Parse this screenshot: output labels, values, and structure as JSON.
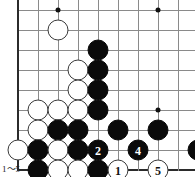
{
  "diagram": {
    "kind": "go-board-diagram",
    "caption": "1～5",
    "board": {
      "cell_size": 20,
      "origin_x": 18,
      "origin_y": 10,
      "cols": 9,
      "rows": 8,
      "left_edge_is_board_border": true,
      "bottom_edge_is_board_border": true,
      "line_color": "#8a8a8a",
      "edge_color": "#2b2b2b",
      "background": "#ffffff",
      "star_points": [
        {
          "col": 2,
          "row": 0
        },
        {
          "col": 7,
          "row": 0
        },
        {
          "col": 7,
          "row": 5
        }
      ]
    },
    "stone_colors": {
      "black": "#0a0a0a",
      "white": "#ffffff",
      "white_outline": "#3a3a3a",
      "black_number": "#ffffff",
      "white_number": "#111111"
    },
    "stones": [
      {
        "col": 2,
        "row": 1,
        "color": "white",
        "label": ""
      },
      {
        "col": 4,
        "row": 2,
        "color": "black",
        "label": ""
      },
      {
        "col": 3,
        "row": 3,
        "color": "white",
        "label": ""
      },
      {
        "col": 4,
        "row": 3,
        "color": "black",
        "label": ""
      },
      {
        "col": 3,
        "row": 4,
        "color": "white",
        "label": ""
      },
      {
        "col": 4,
        "row": 4,
        "color": "black",
        "label": ""
      },
      {
        "col": 1,
        "row": 5,
        "color": "white",
        "label": ""
      },
      {
        "col": 2,
        "row": 5,
        "color": "white",
        "label": ""
      },
      {
        "col": 3,
        "row": 5,
        "color": "white",
        "label": ""
      },
      {
        "col": 4,
        "row": 5,
        "color": "black",
        "label": ""
      },
      {
        "col": 1,
        "row": 6,
        "color": "white",
        "label": ""
      },
      {
        "col": 2,
        "row": 6,
        "color": "black",
        "label": ""
      },
      {
        "col": 3,
        "row": 6,
        "color": "black",
        "label": ""
      },
      {
        "col": 5,
        "row": 6,
        "color": "black",
        "label": ""
      },
      {
        "col": 7,
        "row": 6,
        "color": "black",
        "label": ""
      },
      {
        "col": 0,
        "row": 7,
        "color": "white",
        "label": ""
      },
      {
        "col": 1,
        "row": 7,
        "color": "black",
        "label": ""
      },
      {
        "col": 2,
        "row": 7,
        "color": "white",
        "label": ""
      },
      {
        "col": 3,
        "row": 7,
        "color": "black",
        "label": ""
      },
      {
        "col": 4,
        "row": 7,
        "color": "black",
        "label": "2"
      },
      {
        "col": 6,
        "row": 7,
        "color": "black",
        "label": "4"
      },
      {
        "col": 9,
        "row": 7,
        "color": "black",
        "label": ""
      },
      {
        "col": 1,
        "row": 8,
        "color": "black",
        "label": ""
      },
      {
        "col": 2,
        "row": 8,
        "color": "white",
        "label": ""
      },
      {
        "col": 3,
        "row": 8,
        "color": "white",
        "label": ""
      },
      {
        "col": 4,
        "row": 8,
        "color": "black",
        "label": ""
      },
      {
        "col": 5,
        "row": 8,
        "color": "white",
        "label": "1"
      },
      {
        "col": 7,
        "row": 8,
        "color": "white",
        "label": "5"
      },
      {
        "col": 2,
        "row": 9,
        "color": "white",
        "label": ""
      },
      {
        "col": 4,
        "row": 9,
        "color": "white",
        "label": "3"
      }
    ],
    "move_numbers": [
      {
        "number": "1",
        "color": "white"
      },
      {
        "number": "2",
        "color": "black"
      },
      {
        "number": "3",
        "color": "white"
      },
      {
        "number": "4",
        "color": "black"
      },
      {
        "number": "5",
        "color": "white"
      }
    ]
  }
}
